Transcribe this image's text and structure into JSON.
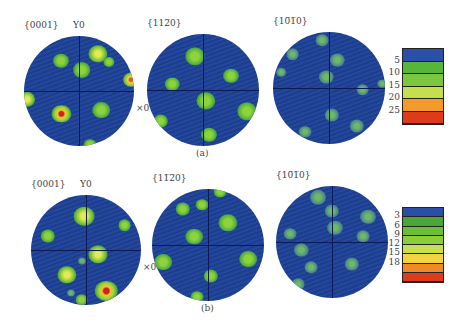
{
  "figure": {
    "rows": [
      {
        "caption": "(a)",
        "plots": [
          {
            "label": "{0001}",
            "axis_y_label": "Y0",
            "axis_x_label": "×0",
            "cx": 79,
            "cy": 91,
            "r": 55,
            "spots": [
              {
                "x": 0.05,
                "y": -0.38,
                "s": 11,
                "level": "green"
              },
              {
                "x": -0.33,
                "y": -0.55,
                "s": 10,
                "level": "green"
              },
              {
                "x": 0.35,
                "y": -0.68,
                "s": 12,
                "level": "yellowgreen"
              },
              {
                "x": 0.55,
                "y": -0.53,
                "s": 7,
                "level": "green"
              },
              {
                "x": 0.95,
                "y": -0.2,
                "s": 10,
                "level": "yellow-red"
              },
              {
                "x": -0.95,
                "y": 0.15,
                "s": 10,
                "level": "yellowgreen"
              },
              {
                "x": -0.32,
                "y": 0.42,
                "s": 12,
                "level": "red"
              },
              {
                "x": 0.4,
                "y": 0.35,
                "s": 11,
                "level": "green"
              },
              {
                "x": 0.2,
                "y": 0.98,
                "s": 8,
                "level": "green"
              }
            ]
          },
          {
            "label": "{11⁠2̅0}",
            "display_label": "{11̅2̅0}",
            "cx": 203,
            "cy": 90,
            "r": 56,
            "spots": [
              {
                "x": -0.14,
                "y": -0.6,
                "s": 12,
                "level": "green"
              },
              {
                "x": 0.5,
                "y": -0.25,
                "s": 10,
                "level": "green"
              },
              {
                "x": -0.55,
                "y": -0.1,
                "s": 9,
                "level": "green"
              },
              {
                "x": 0.05,
                "y": 0.2,
                "s": 12,
                "level": "green"
              },
              {
                "x": 0.78,
                "y": 0.38,
                "s": 12,
                "level": "green"
              },
              {
                "x": -0.75,
                "y": 0.55,
                "s": 9,
                "level": "green"
              },
              {
                "x": 0.1,
                "y": 0.8,
                "s": 10,
                "level": "green"
              }
            ]
          },
          {
            "label": "{10̅1̅0}",
            "cx": 329,
            "cy": 88,
            "r": 56,
            "spots": [
              {
                "x": -0.12,
                "y": -0.85,
                "s": 8,
                "level": "faint"
              },
              {
                "x": -0.65,
                "y": -0.6,
                "s": 8,
                "level": "faint"
              },
              {
                "x": 0.15,
                "y": -0.5,
                "s": 9,
                "level": "faint"
              },
              {
                "x": -0.05,
                "y": -0.2,
                "s": 9,
                "level": "faint"
              },
              {
                "x": -0.85,
                "y": -0.28,
                "s": 6,
                "level": "faint"
              },
              {
                "x": 0.6,
                "y": 0.03,
                "s": 8,
                "level": "faint"
              },
              {
                "x": 0.95,
                "y": -0.08,
                "s": 6,
                "level": "faint"
              },
              {
                "x": 0.05,
                "y": 0.48,
                "s": 9,
                "level": "faint"
              },
              {
                "x": 0.5,
                "y": 0.68,
                "s": 9,
                "level": "faint"
              },
              {
                "x": -0.42,
                "y": 0.78,
                "s": 8,
                "level": "faint"
              }
            ]
          }
        ],
        "colorbar": {
          "top": 48,
          "height": 75,
          "ticks": [
            "5",
            "10",
            "15",
            "20",
            "25"
          ],
          "segments": [
            "#2a4fa8",
            "#57b63a",
            "#7cc73b",
            "#c3df4d",
            "#f39a28",
            "#de3a1c"
          ]
        }
      },
      {
        "caption": "(b)",
        "plots": [
          {
            "label": "{0001}",
            "axis_y_label": "Y0",
            "axis_x_label": "×0",
            "cx": 86,
            "cy": 250,
            "r": 55,
            "spots": [
              {
                "x": -0.03,
                "y": -0.62,
                "s": 13,
                "level": "yellowgreen"
              },
              {
                "x": 0.7,
                "y": -0.45,
                "s": 8,
                "level": "green"
              },
              {
                "x": -0.7,
                "y": -0.25,
                "s": 9,
                "level": "green"
              },
              {
                "x": 0.22,
                "y": 0.08,
                "s": 12,
                "level": "yellowgreen"
              },
              {
                "x": -0.35,
                "y": 0.45,
                "s": 12,
                "level": "yellowgreen"
              },
              {
                "x": -0.07,
                "y": 0.2,
                "s": 5,
                "level": "faint"
              },
              {
                "x": 0.37,
                "y": 0.75,
                "s": 14,
                "level": "red"
              },
              {
                "x": -0.28,
                "y": 0.78,
                "s": 5,
                "level": "faint"
              },
              {
                "x": -0.08,
                "y": 0.9,
                "s": 8,
                "level": "green"
              }
            ]
          },
          {
            "label": "{11̅2̅0}",
            "cx": 208,
            "cy": 245,
            "r": 56,
            "spots": [
              {
                "x": -0.45,
                "y": -0.65,
                "s": 9,
                "level": "green"
              },
              {
                "x": -0.1,
                "y": -0.72,
                "s": 8,
                "level": "green"
              },
              {
                "x": 0.35,
                "y": -0.4,
                "s": 12,
                "level": "green"
              },
              {
                "x": -0.25,
                "y": -0.15,
                "s": 11,
                "level": "green"
              },
              {
                "x": 0.72,
                "y": 0.25,
                "s": 11,
                "level": "green"
              },
              {
                "x": -0.8,
                "y": 0.3,
                "s": 11,
                "level": "green"
              },
              {
                "x": 0.05,
                "y": 0.55,
                "s": 9,
                "level": "green"
              },
              {
                "x": -0.2,
                "y": 0.92,
                "s": 8,
                "level": "green"
              },
              {
                "x": 0.22,
                "y": -0.95,
                "s": 8,
                "level": "green"
              }
            ]
          },
          {
            "label": "{10̅1̅0}",
            "cx": 332,
            "cy": 242,
            "r": 56,
            "spots": [
              {
                "x": -0.25,
                "y": -0.8,
                "s": 10,
                "level": "faint"
              },
              {
                "x": 0.0,
                "y": -0.55,
                "s": 9,
                "level": "faint"
              },
              {
                "x": 0.65,
                "y": -0.45,
                "s": 10,
                "level": "faint"
              },
              {
                "x": 0.05,
                "y": -0.25,
                "s": 10,
                "level": "faint"
              },
              {
                "x": -0.75,
                "y": -0.15,
                "s": 8,
                "level": "faint"
              },
              {
                "x": 0.55,
                "y": -0.1,
                "s": 8,
                "level": "faint"
              },
              {
                "x": -0.55,
                "y": 0.15,
                "s": 9,
                "level": "faint"
              },
              {
                "x": -0.38,
                "y": 0.45,
                "s": 8,
                "level": "faint"
              },
              {
                "x": 0.35,
                "y": 0.4,
                "s": 9,
                "level": "faint"
              },
              {
                "x": -0.6,
                "y": 0.75,
                "s": 8,
                "level": "faint"
              }
            ]
          }
        ],
        "colorbar": {
          "top": 207,
          "height": 74,
          "ticks": [
            "3",
            "6",
            "9",
            "12",
            "15",
            "18"
          ],
          "segments": [
            "#2a4fa8",
            "#4ba63a",
            "#6cbf35",
            "#8ccd3a",
            "#c9df4c",
            "#f1d33d",
            "#f08a25",
            "#de3a1c"
          ]
        }
      }
    ]
  },
  "colors": {
    "background": "#ffffff",
    "pole_figure_bg": "#22459a",
    "axis_line": "#0c1a55"
  }
}
